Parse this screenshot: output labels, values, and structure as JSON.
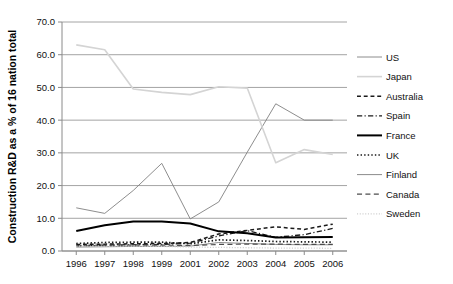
{
  "chart_data": {
    "type": "line",
    "title": "",
    "xlabel": "",
    "ylabel": "Construction R&D as a % of 16 nation total",
    "categories": [
      "1996",
      "1997",
      "1998",
      "1999",
      "2001",
      "2002",
      "2003",
      "2004",
      "2005",
      "2006"
    ],
    "ylim": [
      0.0,
      70.0
    ],
    "ytick_labels": [
      "0.0",
      "10.0",
      "20.0",
      "30.0",
      "40.0",
      "50.0",
      "60.0",
      "70.0"
    ],
    "ytick_values": [
      0.0,
      10.0,
      20.0,
      30.0,
      40.0,
      50.0,
      60.0,
      70.0
    ],
    "grid": true,
    "legend_position": "right",
    "series": [
      {
        "name": "US",
        "color": "#808080",
        "style": "solid",
        "width": 0.9,
        "values": [
          13.2,
          11.5,
          18.5,
          26.8,
          9.8,
          15.0,
          30.2,
          45.0,
          40.0,
          40.0
        ]
      },
      {
        "name": "Japan",
        "color": "#d4d4d4",
        "style": "solid",
        "width": 1.6,
        "values": [
          63.0,
          61.5,
          49.5,
          48.5,
          47.8,
          50.2,
          49.8,
          27.0,
          31.0,
          29.5
        ]
      },
      {
        "name": "Australia",
        "color": "#1a1a1a",
        "style": "dashed",
        "width": 1.5,
        "values": [
          2.0,
          2.1,
          2.2,
          2.3,
          2.6,
          5.2,
          6.3,
          7.4,
          6.6,
          8.2
        ]
      },
      {
        "name": "Spain",
        "color": "#1a1a1a",
        "style": "dashdot",
        "width": 1.3,
        "values": [
          1.6,
          1.8,
          1.9,
          2.0,
          2.4,
          4.6,
          6.2,
          4.2,
          5.0,
          6.9
        ]
      },
      {
        "name": "France",
        "color": "#000000",
        "style": "solid",
        "width": 2.0,
        "values": [
          6.1,
          7.9,
          9.0,
          9.0,
          8.4,
          6.0,
          5.4,
          4.1,
          4.2,
          4.3
        ]
      },
      {
        "name": "UK",
        "color": "#1a1a1a",
        "style": "dotted",
        "width": 1.7,
        "values": [
          2.3,
          2.6,
          2.7,
          2.7,
          2.2,
          3.4,
          3.2,
          2.9,
          2.8,
          2.7
        ]
      },
      {
        "name": "Finland",
        "color": "#8c8c8c",
        "style": "solid",
        "width": 1.0,
        "values": [
          1.2,
          1.3,
          1.4,
          1.4,
          1.5,
          2.6,
          2.3,
          2.0,
          1.9,
          1.9
        ]
      },
      {
        "name": "Canada",
        "color": "#4d4d4d",
        "style": "dashed-long",
        "width": 1.2,
        "values": [
          1.6,
          1.7,
          1.8,
          1.8,
          1.7,
          2.0,
          2.1,
          2.1,
          2.0,
          2.0
        ]
      },
      {
        "name": "Sweden",
        "color": "#cfcfcf",
        "style": "dotted",
        "width": 1.3,
        "values": [
          1.5,
          1.5,
          1.5,
          1.4,
          1.2,
          1.1,
          1.0,
          0.9,
          0.9,
          0.8
        ]
      }
    ]
  },
  "legend": {
    "items": [
      {
        "label": "US"
      },
      {
        "label": "Japan"
      },
      {
        "label": "Australia"
      },
      {
        "label": "Spain"
      },
      {
        "label": "France"
      },
      {
        "label": "UK"
      },
      {
        "label": "Finland"
      },
      {
        "label": "Canada"
      },
      {
        "label": "Sweden"
      }
    ]
  }
}
